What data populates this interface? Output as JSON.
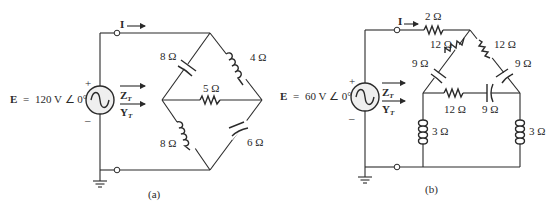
{
  "circuits": [
    {
      "id": "a",
      "caption": "(a)",
      "source": {
        "label_E": "E",
        "equals": "=",
        "value": "120 V ∠ 0°",
        "plus": "+",
        "minus": "–"
      },
      "current_label": "I",
      "impedance_label": "Z",
      "admittance_label": "Y",
      "subscript": "T",
      "components": [
        {
          "type": "capacitor",
          "value": "8 Ω",
          "position": "upper-left branch"
        },
        {
          "type": "inductor",
          "value": "4 Ω",
          "position": "upper-right branch"
        },
        {
          "type": "resistor",
          "value": "5 Ω",
          "position": "center bridge"
        },
        {
          "type": "inductor",
          "value": "8 Ω",
          "position": "lower-left branch"
        },
        {
          "type": "capacitor",
          "value": "6 Ω",
          "position": "lower-right branch"
        }
      ]
    },
    {
      "id": "b",
      "caption": "(b)",
      "source": {
        "label_E": "E",
        "equals": "=",
        "value": "60 V ∠ 0°",
        "plus": "+",
        "minus": "–"
      },
      "current_label": "I",
      "impedance_label": "Z",
      "admittance_label": "Y",
      "subscript": "T",
      "components": [
        {
          "type": "resistor",
          "value": "2 Ω",
          "position": "top series"
        },
        {
          "type": "resistor",
          "value": "12 Ω",
          "position": "upper-left branch"
        },
        {
          "type": "resistor",
          "value": "12 Ω",
          "position": "upper-right branch"
        },
        {
          "type": "capacitor",
          "value": "9 Ω",
          "position": "mid-left branch"
        },
        {
          "type": "capacitor",
          "value": "9 Ω",
          "position": "mid-right branch"
        },
        {
          "type": "resistor",
          "value": "12 Ω",
          "position": "horizontal bridge"
        },
        {
          "type": "capacitor",
          "value": "9 Ω",
          "position": "horizontal bridge"
        },
        {
          "type": "inductor",
          "value": "3 Ω",
          "position": "left leg"
        },
        {
          "type": "inductor",
          "value": "3 Ω",
          "position": "right leg"
        }
      ]
    }
  ]
}
